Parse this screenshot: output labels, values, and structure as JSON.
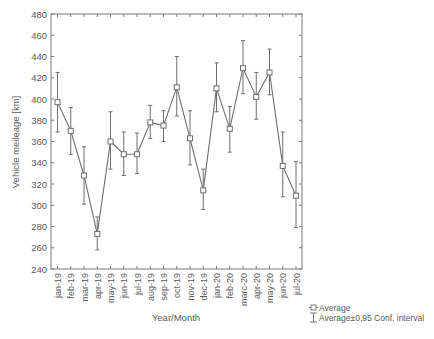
{
  "chart_data": {
    "type": "line",
    "title": "",
    "xlabel": "Year/Month",
    "ylabel": "Vehicle meileage [km]",
    "ylim": [
      240,
      480
    ],
    "yticks": [
      240,
      260,
      280,
      300,
      320,
      340,
      360,
      380,
      400,
      420,
      440,
      460,
      480
    ],
    "grid": false,
    "legend_position": "bottom-right",
    "categories": [
      "jan-19",
      "feb-19",
      "mar-19",
      "apr-19",
      "may-19",
      "jun-19",
      "jul-19",
      "aug-19",
      "sep-19",
      "oct-19",
      "nov-19",
      "dec-19",
      "jan-20",
      "feb-20",
      "marc-20",
      "apr-20",
      "may-20",
      "jun-20",
      "jul-20"
    ],
    "series": [
      {
        "name": "Average",
        "marker": "square",
        "values": [
          397,
          370,
          328,
          273,
          360,
          348,
          348,
          378,
          375,
          411,
          363,
          314,
          410,
          372,
          429,
          402,
          425,
          337,
          309
        ]
      },
      {
        "name": "Average±0,95 Conf. interval",
        "type": "errorbar",
        "lower": [
          369,
          348,
          301,
          258,
          334,
          328,
          330,
          363,
          360,
          384,
          338,
          296,
          388,
          350,
          405,
          381,
          404,
          308,
          279
        ],
        "upper": [
          425,
          392,
          355,
          289,
          388,
          369,
          368,
          394,
          389,
          440,
          389,
          334,
          434,
          393,
          455,
          425,
          447,
          369,
          341
        ]
      }
    ],
    "legend": [
      {
        "label": "Average",
        "symbol": "square-marker-line"
      },
      {
        "label": "Average±0,95 Conf. interval",
        "symbol": "errorbar-whisker"
      }
    ],
    "colors": {
      "line": "#6e6e6e",
      "axis": "#7a7a7a",
      "text": "#5a5a5a"
    }
  }
}
